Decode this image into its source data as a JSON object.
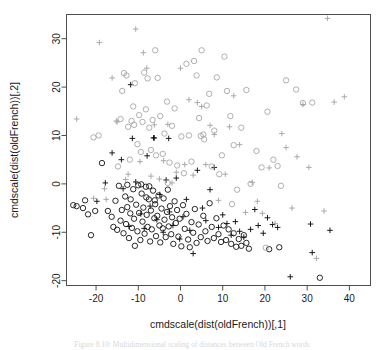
{
  "figure": {
    "background_color": "#ffffff",
    "frame_color": "#4d4d4d",
    "caption": "Figure 8.10: Multidimensional scaling of distances between Old French words"
  },
  "chart_data": {
    "type": "scatter",
    "title": "",
    "xlabel": "cmdscale(dist(oldFrench))[,1]",
    "ylabel": "cmdscale(dist(oldFrench))[,2]",
    "xlim": [
      -27,
      45
    ],
    "ylim": [
      -21,
      35
    ],
    "xticks": [
      -20,
      -10,
      0,
      10,
      20,
      30,
      40
    ],
    "yticks": [
      -20,
      -10,
      0,
      10,
      20,
      30
    ],
    "xtick_labels": [
      "-20",
      "-10",
      "0",
      "10",
      "20",
      "30",
      "40"
    ],
    "ytick_labels": [
      "-20",
      "-10",
      "0",
      "10",
      "20",
      "30"
    ],
    "grid": false,
    "legend": "none",
    "marker_colors": {
      "dark": "#111111",
      "light": "#a6a6a6"
    },
    "series": [
      {
        "name": "circle-dark",
        "marker": "circle",
        "color": "#111111",
        "points": [
          [
            -25.4,
            -4.4
          ],
          [
            -24.6,
            -4.6
          ],
          [
            -23.1,
            -5.0
          ],
          [
            -22.6,
            -3.4
          ],
          [
            -21.9,
            -6.3
          ],
          [
            -21.2,
            -10.6
          ],
          [
            -20.2,
            -5.6
          ],
          [
            -18.6,
            4.3
          ],
          [
            -17.2,
            -5.6
          ],
          [
            -16.3,
            -6.8
          ],
          [
            -15.9,
            -8.9
          ],
          [
            -15.4,
            -3.5
          ],
          [
            -15.0,
            -9.5
          ],
          [
            -14.6,
            -0.4
          ],
          [
            -14.2,
            -7.6
          ],
          [
            -13.9,
            -5.4
          ],
          [
            -13.5,
            -10.2
          ],
          [
            -13.1,
            -2.6
          ],
          [
            -12.9,
            -8.3
          ],
          [
            -12.6,
            -4.8
          ],
          [
            -12.2,
            -11.2
          ],
          [
            -11.9,
            -6.1
          ],
          [
            -11.5,
            -9.1
          ],
          [
            -11.2,
            -1.1
          ],
          [
            -11.0,
            -7.2
          ],
          [
            -10.8,
            -12.8
          ],
          [
            -10.5,
            -4.3
          ],
          [
            -10.2,
            -9.8
          ],
          [
            -10.0,
            -0.3
          ],
          [
            -9.8,
            -6.0
          ],
          [
            -9.5,
            -11.6
          ],
          [
            -9.2,
            -2.0
          ],
          [
            -9.0,
            -7.8
          ],
          [
            -8.8,
            -4.9
          ],
          [
            -8.5,
            -10.3
          ],
          [
            -8.2,
            -0.6
          ],
          [
            -8.0,
            -6.4
          ],
          [
            -7.8,
            -8.9
          ],
          [
            -7.5,
            -3.2
          ],
          [
            -7.2,
            -11.9
          ],
          [
            -7.0,
            -5.5
          ],
          [
            -6.8,
            -9.4
          ],
          [
            -6.5,
            -1.4
          ],
          [
            -6.2,
            -7.1
          ],
          [
            -6.0,
            -4.2
          ],
          [
            -5.8,
            -10.8
          ],
          [
            -5.5,
            -6.6
          ],
          [
            -5.2,
            -2.4
          ],
          [
            -5.0,
            -8.6
          ],
          [
            -4.8,
            -12.1
          ],
          [
            -4.5,
            -5.1
          ],
          [
            -4.2,
            -9.2
          ],
          [
            -4.0,
            -3.0
          ],
          [
            -3.8,
            -7.4
          ],
          [
            -3.5,
            -11.0
          ],
          [
            -3.2,
            -5.8
          ],
          [
            -3.0,
            -1.2
          ],
          [
            -2.8,
            -8.8
          ],
          [
            -2.5,
            -4.6
          ],
          [
            -2.2,
            -10.4
          ],
          [
            -2.0,
            -6.9
          ],
          [
            -1.7,
            -12.4
          ],
          [
            -1.4,
            -3.6
          ],
          [
            -1.1,
            -8.1
          ],
          [
            -0.8,
            -5.4
          ],
          [
            -0.5,
            -10.9
          ],
          [
            -0.2,
            -7.2
          ],
          [
            0.2,
            -12.9
          ],
          [
            0.6,
            -4.4
          ],
          [
            1.0,
            -9.3
          ],
          [
            1.4,
            -6.2
          ],
          [
            1.8,
            -11.5
          ],
          [
            2.2,
            -13.1
          ],
          [
            2.6,
            -7.9
          ],
          [
            3.0,
            -10.1
          ],
          [
            3.4,
            -5.2
          ],
          [
            3.8,
            -12.2
          ],
          [
            4.3,
            -8.4
          ],
          [
            4.8,
            -11.0
          ],
          [
            5.4,
            -6.6
          ],
          [
            5.9,
            -9.8
          ],
          [
            6.4,
            -11.8
          ],
          [
            6.9,
            -4.0
          ],
          [
            7.4,
            -8.9
          ],
          [
            7.9,
            -11.2
          ],
          [
            8.5,
            -7.1
          ],
          [
            9.0,
            -10.4
          ],
          [
            9.6,
            -12.0
          ],
          [
            10.2,
            -8.6
          ],
          [
            10.8,
            -11.6
          ],
          [
            11.4,
            -9.4
          ],
          [
            12.0,
            -12.4
          ],
          [
            12.6,
            -10.2
          ],
          [
            13.2,
            -13.0
          ],
          [
            13.8,
            -11.4
          ],
          [
            14.4,
            -12.8
          ],
          [
            15.0,
            -10.6
          ],
          [
            15.6,
            -12.2
          ],
          [
            16.2,
            -13.4
          ],
          [
            21.0,
            -13.5
          ],
          [
            23.4,
            -13.1
          ],
          [
            33.0,
            -19.4
          ],
          [
            -12.6,
            -0.2
          ],
          [
            -9.3,
            -0.1
          ],
          [
            -7.4,
            -0.5
          ],
          [
            -11.8,
            -3.2
          ],
          [
            -8.1,
            -2.8
          ],
          [
            -6.1,
            -3.4
          ]
        ]
      },
      {
        "name": "plus-dark",
        "marker": "plus",
        "color": "#111111",
        "points": [
          [
            -19.8,
            -3.6
          ],
          [
            -17.8,
            0.2
          ],
          [
            -16.2,
            6.4
          ],
          [
            -14.0,
            5.0
          ],
          [
            -13.6,
            -1.0
          ],
          [
            -12.2,
            -8.8
          ],
          [
            -11.4,
            9.4
          ],
          [
            -10.6,
            0.4
          ],
          [
            -11.8,
            20.5
          ],
          [
            -9.4,
            -6.2
          ],
          [
            -8.6,
            -9.2
          ],
          [
            -7.9,
            5.8
          ],
          [
            -7.2,
            -4.6
          ],
          [
            -6.4,
            9.5
          ],
          [
            -5.6,
            -7.4
          ],
          [
            -4.9,
            -2.2
          ],
          [
            -4.1,
            -10.0
          ],
          [
            -3.4,
            0.8
          ],
          [
            -2.6,
            -5.8
          ],
          [
            -1.8,
            -8.6
          ],
          [
            -1.0,
            1.2
          ],
          [
            -0.2,
            -11.4
          ],
          [
            0.6,
            -6.8
          ],
          [
            1.4,
            -3.2
          ],
          [
            2.2,
            -9.6
          ],
          [
            3.0,
            -14.4
          ],
          [
            4.0,
            2.8
          ],
          [
            5.2,
            -5.0
          ],
          [
            6.0,
            -7.6
          ],
          [
            7.0,
            -1.2
          ],
          [
            8.0,
            3.4
          ],
          [
            9.0,
            -9.0
          ],
          [
            10.0,
            -6.4
          ],
          [
            11.0,
            -8.2
          ],
          [
            12.0,
            -10.6
          ],
          [
            13.0,
            -7.8
          ],
          [
            14.0,
            -9.8
          ],
          [
            15.0,
            -11.0
          ],
          [
            16.6,
            -9.4
          ],
          [
            17.6,
            -5.3
          ],
          [
            18.4,
            -8.6
          ],
          [
            19.6,
            -10.2
          ],
          [
            20.6,
            -7.0
          ],
          [
            21.8,
            -8.4
          ],
          [
            23.0,
            -9.0
          ],
          [
            26.0,
            -19.2
          ],
          [
            30.8,
            -8.3
          ],
          [
            31.2,
            -14.2
          ],
          [
            35.4,
            -9.6
          ],
          [
            -6.2,
            9.5
          ],
          [
            -2.8,
            9.4
          ]
        ]
      },
      {
        "name": "circle-light",
        "marker": "circle",
        "color": "#a6a6a6",
        "points": [
          [
            -20.6,
            9.6
          ],
          [
            -19.4,
            10.0
          ],
          [
            -14.8,
            3.6
          ],
          [
            -14.2,
            13.4
          ],
          [
            -13.8,
            19.2
          ],
          [
            -13.4,
            22.9
          ],
          [
            -12.8,
            22.4
          ],
          [
            -12.4,
            11.8
          ],
          [
            -12.0,
            5.0
          ],
          [
            -11.6,
            13.0
          ],
          [
            -11.2,
            16.0
          ],
          [
            -10.8,
            20.8
          ],
          [
            -10.2,
            8.2
          ],
          [
            -9.8,
            14.2
          ],
          [
            -9.4,
            6.6
          ],
          [
            -9.0,
            12.8
          ],
          [
            -8.6,
            23.0
          ],
          [
            -8.2,
            15.4
          ],
          [
            -7.8,
            21.8
          ],
          [
            -7.4,
            11.6
          ],
          [
            -7.0,
            7.0
          ],
          [
            -6.6,
            13.2
          ],
          [
            -6.0,
            27.6
          ],
          [
            -5.4,
            21.9
          ],
          [
            -4.8,
            14.0
          ],
          [
            -4.2,
            6.2
          ],
          [
            -3.8,
            10.4
          ],
          [
            -3.2,
            17.0
          ],
          [
            -2.6,
            4.4
          ],
          [
            -2.0,
            12.0
          ],
          [
            -1.4,
            15.6
          ],
          [
            -0.8,
            3.8
          ],
          [
            0.2,
            9.8
          ],
          [
            0.8,
            2.2
          ],
          [
            1.4,
            24.8
          ],
          [
            2.0,
            10.0
          ],
          [
            2.6,
            4.6
          ],
          [
            3.2,
            25.4
          ],
          [
            3.8,
            22.4
          ],
          [
            4.4,
            13.6
          ],
          [
            5.0,
            27.6
          ],
          [
            5.6,
            9.2
          ],
          [
            6.2,
            16.2
          ],
          [
            6.8,
            18.6
          ],
          [
            7.4,
            3.6
          ],
          [
            8.0,
            11.0
          ],
          [
            8.6,
            22.0
          ],
          [
            9.2,
            2.0
          ],
          [
            9.8,
            5.9
          ],
          [
            10.4,
            26.3
          ],
          [
            11.0,
            19.2
          ],
          [
            11.8,
            14.0
          ],
          [
            12.6,
            8.0
          ],
          [
            13.4,
            -1.2
          ],
          [
            14.4,
            11.6
          ],
          [
            15.6,
            19.4
          ],
          [
            16.6,
            0.0
          ],
          [
            18.0,
            6.8
          ],
          [
            19.2,
            3.4
          ],
          [
            20.6,
            14.9
          ],
          [
            22.0,
            5.0
          ],
          [
            23.0,
            3.7
          ],
          [
            23.8,
            -0.4
          ],
          [
            25.0,
            21.4
          ],
          [
            27.4,
            19.5
          ],
          [
            29.0,
            16.7
          ],
          [
            31.2,
            16.8
          ],
          [
            -11.0,
            12.2
          ],
          [
            -5.8,
            5.9
          ],
          [
            -3.0,
            0.2
          ],
          [
            4.8,
            9.9
          ],
          [
            5.4,
            10.2
          ],
          [
            12.2,
            -4.2
          ],
          [
            20.2,
            -13.2
          ]
        ]
      },
      {
        "name": "plus-light",
        "marker": "plus",
        "color": "#a6a6a6",
        "points": [
          [
            -24.6,
            13.4
          ],
          [
            -19.2,
            29.2
          ],
          [
            -18.0,
            -1.0
          ],
          [
            -17.6,
            -3.2
          ],
          [
            -16.2,
            21.9
          ],
          [
            -15.2,
            13.0
          ],
          [
            -13.0,
            0.9
          ],
          [
            -12.4,
            2.0
          ],
          [
            -10.6,
            32.0
          ],
          [
            -9.6,
            4.6
          ],
          [
            -8.8,
            27.1
          ],
          [
            -8.0,
            23.9
          ],
          [
            -7.0,
            1.6
          ],
          [
            -6.2,
            12.2
          ],
          [
            -5.0,
            1.0
          ],
          [
            -4.0,
            4.8
          ],
          [
            -3.0,
            12.3
          ],
          [
            -2.0,
            0.2
          ],
          [
            -1.0,
            2.4
          ],
          [
            0.0,
            23.9
          ],
          [
            1.0,
            4.0
          ],
          [
            2.0,
            17.4
          ],
          [
            3.0,
            1.8
          ],
          [
            4.0,
            16.8
          ],
          [
            5.0,
            16.0
          ],
          [
            6.0,
            4.0
          ],
          [
            7.0,
            12.1
          ],
          [
            8.0,
            10.2
          ],
          [
            9.0,
            -3.4
          ],
          [
            10.6,
            2.0
          ],
          [
            11.6,
            11.8
          ],
          [
            12.6,
            18.2
          ],
          [
            14.0,
            8.1
          ],
          [
            15.4,
            -5.9
          ],
          [
            17.0,
            0.3
          ],
          [
            18.2,
            -3.6
          ],
          [
            19.4,
            -6.1
          ],
          [
            21.0,
            3.3
          ],
          [
            22.4,
            -8.2
          ],
          [
            24.0,
            10.4
          ],
          [
            25.0,
            7.5
          ],
          [
            26.4,
            -5.0
          ],
          [
            27.6,
            5.6
          ],
          [
            29.0,
            16.4
          ],
          [
            30.4,
            3.4
          ],
          [
            32.2,
            -15.4
          ],
          [
            34.0,
            -5.6
          ],
          [
            34.8,
            34.2
          ],
          [
            36.4,
            16.9
          ],
          [
            38.8,
            18.0
          ],
          [
            -20.6,
            -3.0
          ],
          [
            -15.0,
            12.8
          ]
        ]
      }
    ]
  }
}
